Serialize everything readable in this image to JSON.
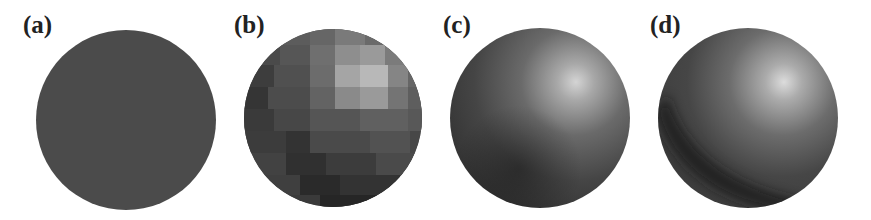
{
  "figure": {
    "panels": [
      {
        "id": "a",
        "label": "(a)",
        "shading": "flat-constant",
        "description": "uniform gray sphere, no shading"
      },
      {
        "id": "b",
        "label": "(b)",
        "shading": "faceted",
        "description": "flat-shaded faceted sphere with visible quad patches"
      },
      {
        "id": "c",
        "label": "(c)",
        "shading": "smooth",
        "description": "smoothly shaded sphere with specular highlight upper right"
      },
      {
        "id": "d",
        "label": "(d)",
        "shading": "smooth-with-shadow",
        "description": "smoothly shaded sphere with highlight and darker crescent at lower left"
      }
    ],
    "colors": {
      "background": "#ffffff",
      "sphere_base": "#4a4a4a",
      "highlight": "#d8d8d8",
      "shadow": "#1e1e1e",
      "label": "#222222"
    }
  }
}
